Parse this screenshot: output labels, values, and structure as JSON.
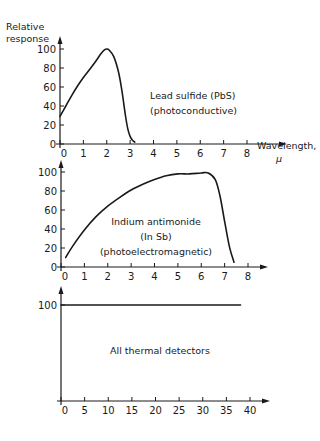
{
  "figure": {
    "ylabel_line1": "Relative",
    "ylabel_line2": "response",
    "xlabel_line1": "Wavelength,",
    "xlabel_line2": "μ",
    "ink_color": "#1a1a1a",
    "background": "#ffffff"
  },
  "chart_data": [
    {
      "type": "line",
      "title": "Lead sulfide (PbS) (photoconductive)",
      "annotation": [
        "Lead sulfide (PbS)",
        "(photoconductive)"
      ],
      "xlabel": "Wavelength, μ",
      "ylabel": "Relative response",
      "xlim": [
        0,
        8
      ],
      "ylim": [
        0,
        100
      ],
      "xticks": [
        0,
        1,
        2,
        3,
        4,
        5,
        6,
        7,
        8
      ],
      "yticks": [
        0,
        20,
        40,
        60,
        80,
        100
      ],
      "x": [
        0.0,
        0.25,
        0.5,
        0.75,
        1.0,
        1.25,
        1.5,
        1.75,
        1.9,
        2.0,
        2.1,
        2.3,
        2.5,
        2.65,
        2.8,
        2.9,
        3.0,
        3.1,
        3.2
      ],
      "y": [
        29,
        40,
        51,
        61,
        70,
        78,
        86,
        95,
        99,
        100,
        99,
        92,
        76,
        56,
        30,
        16,
        8,
        4,
        2
      ]
    },
    {
      "type": "line",
      "title": "Indium antimonide (InSb) (photoelectromagnetic)",
      "annotation": [
        "Indium antimonide",
        "(In Sb)",
        "(photoelectromagnetic)"
      ],
      "xlabel": "Wavelength, μ",
      "ylabel": "Relative response",
      "xlim": [
        0,
        8
      ],
      "ylim": [
        0,
        100
      ],
      "xticks": [
        0,
        1,
        2,
        3,
        4,
        5,
        6,
        7,
        8
      ],
      "yticks": [
        0,
        20,
        40,
        60,
        80,
        100
      ],
      "x": [
        0.2,
        0.5,
        1.0,
        1.5,
        2.0,
        2.5,
        3.0,
        3.5,
        4.0,
        4.5,
        5.0,
        5.5,
        6.0,
        6.3,
        6.6,
        6.8,
        7.0,
        7.2,
        7.4
      ],
      "y": [
        10,
        22,
        39,
        53,
        64,
        73,
        81,
        87,
        92,
        96,
        98,
        98,
        99,
        99,
        92,
        75,
        48,
        22,
        5
      ]
    },
    {
      "type": "line",
      "title": "All thermal detectors",
      "annotation": [
        "All thermal detectors"
      ],
      "xlabel": "Wavelength, μ",
      "ylabel": "Relative response",
      "xlim": [
        0,
        40
      ],
      "ylim": [
        0,
        100
      ],
      "xticks": [
        0,
        5,
        10,
        15,
        20,
        25,
        30,
        35,
        40
      ],
      "yticks": [
        100
      ],
      "x": [
        0,
        38
      ],
      "y": [
        100,
        100
      ]
    }
  ]
}
